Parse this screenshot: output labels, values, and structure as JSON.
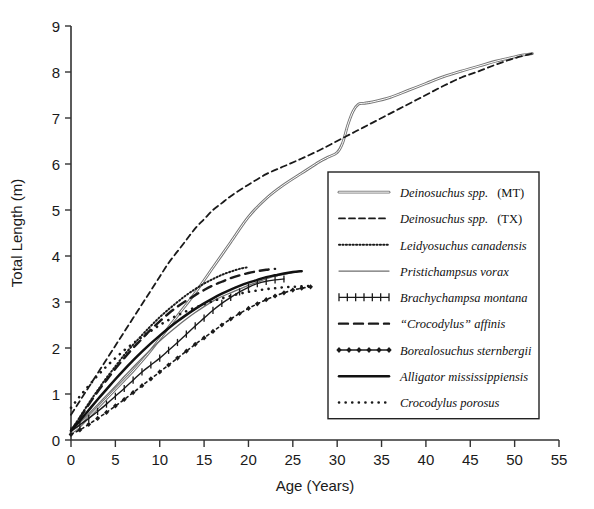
{
  "figure": {
    "name": "crocodylian-growth-curves",
    "background": "#ffffff"
  },
  "chart_data": {
    "type": "line",
    "title": "",
    "xlabel": "Age (Years)",
    "ylabel": "Total Length (m)",
    "xlim": [
      0,
      55
    ],
    "ylim": [
      0,
      9
    ],
    "xticks": [
      0,
      5,
      10,
      15,
      20,
      25,
      30,
      35,
      40,
      45,
      50,
      55
    ],
    "yticks": [
      0,
      1,
      2,
      3,
      4,
      5,
      6,
      7,
      8,
      9
    ],
    "grid": false,
    "legend_position": "center-right-inside",
    "series": [
      {
        "name": "Deinosuchus spp.  (MT)",
        "label_italic": "Deinosuchus spp.",
        "label_plain": "(MT)",
        "style": "double-thin-solid",
        "color": "#555555",
        "width": 1.1,
        "x": [
          0,
          1,
          2,
          3,
          4,
          5,
          6,
          7,
          8,
          9,
          10,
          12,
          14,
          16,
          18,
          20,
          22,
          24,
          26,
          28,
          29,
          30,
          30.6,
          31.2,
          31.8,
          32.4,
          33,
          34,
          36,
          38,
          40,
          42,
          44,
          46,
          48,
          50,
          51,
          52
        ],
        "y": [
          0.15,
          0.3,
          0.5,
          0.7,
          0.9,
          1.1,
          1.3,
          1.5,
          1.72,
          1.95,
          2.2,
          2.7,
          3.2,
          3.75,
          4.3,
          4.85,
          5.25,
          5.55,
          5.8,
          6.05,
          6.15,
          6.25,
          6.45,
          6.85,
          7.15,
          7.3,
          7.32,
          7.35,
          7.45,
          7.6,
          7.75,
          7.9,
          8.02,
          8.13,
          8.24,
          8.33,
          8.37,
          8.4
        ]
      },
      {
        "name": "Deinosuchus spp.  (TX)",
        "label_italic": "Deinosuchus spp.",
        "label_plain": "(TX)",
        "style": "dashed",
        "color": "#1a1a1a",
        "width": 1.8,
        "x": [
          0,
          1,
          2,
          3,
          4,
          5,
          6,
          7,
          8,
          9,
          10,
          11,
          12,
          13,
          14,
          15,
          16,
          17,
          18,
          20,
          22,
          24,
          26,
          28,
          30,
          32,
          34,
          36,
          38,
          40,
          42,
          44,
          46,
          48,
          50,
          52
        ],
        "y": [
          0.55,
          0.85,
          1.15,
          1.45,
          1.75,
          2.05,
          2.35,
          2.65,
          2.95,
          3.25,
          3.55,
          3.85,
          4.1,
          4.35,
          4.6,
          4.8,
          5.0,
          5.15,
          5.3,
          5.55,
          5.78,
          5.95,
          6.12,
          6.3,
          6.5,
          6.7,
          6.9,
          7.1,
          7.3,
          7.5,
          7.7,
          7.88,
          8.02,
          8.17,
          8.3,
          8.4
        ]
      },
      {
        "name": "Leidyosuchus canadensis",
        "label_italic": "Leidyosuchus canadensis",
        "label_plain": "",
        "style": "fine-dotted",
        "color": "#1a1a1a",
        "width": 2.0,
        "x": [
          0,
          1,
          2,
          3,
          4,
          5,
          6,
          7,
          8,
          9,
          10,
          11,
          12,
          13,
          14,
          15,
          16,
          17,
          18,
          19,
          20
        ],
        "y": [
          0.2,
          0.5,
          0.8,
          1.08,
          1.35,
          1.6,
          1.85,
          2.07,
          2.28,
          2.48,
          2.67,
          2.84,
          3.0,
          3.15,
          3.28,
          3.4,
          3.5,
          3.59,
          3.66,
          3.72,
          3.76
        ]
      },
      {
        "name": "Pristichampsus vorax",
        "label_italic": "Pristichampsus vorax",
        "label_plain": "",
        "style": "thin-solid",
        "color": "#6e6e6e",
        "width": 1.3,
        "x": [
          0,
          1,
          2,
          3,
          4,
          5,
          6,
          7,
          8,
          9,
          10,
          11,
          12,
          13,
          14,
          15,
          16,
          17,
          18,
          19,
          20,
          21,
          22,
          23,
          24,
          25,
          26
        ],
        "y": [
          0.2,
          0.38,
          0.57,
          0.77,
          0.97,
          1.17,
          1.38,
          1.58,
          1.78,
          1.97,
          2.15,
          2.32,
          2.48,
          2.63,
          2.77,
          2.9,
          3.02,
          3.12,
          3.2,
          3.28,
          3.36,
          3.43,
          3.5,
          3.56,
          3.6,
          3.64,
          3.68
        ]
      },
      {
        "name": "Brachychampsa montana",
        "label_italic": "Brachychampsa montana",
        "label_plain": "",
        "style": "plus-marked",
        "color": "#1a1a1a",
        "width": 1.4,
        "x": [
          0,
          1,
          2,
          3,
          4,
          5,
          6,
          7,
          8,
          9,
          10,
          11,
          12,
          13,
          14,
          15,
          16,
          17,
          18,
          19,
          20,
          21,
          22,
          23,
          24
        ],
        "y": [
          0.2,
          0.33,
          0.47,
          0.62,
          0.78,
          0.95,
          1.12,
          1.3,
          1.48,
          1.63,
          1.78,
          1.95,
          2.12,
          2.3,
          2.48,
          2.65,
          2.82,
          2.97,
          3.1,
          3.22,
          3.32,
          3.4,
          3.45,
          3.48,
          3.5
        ]
      },
      {
        "name": "“Crocodylus” affinis",
        "label_italic": "“Crocodylus” affinis",
        "label_plain": "",
        "style": "thick-dashed",
        "color": "#1a1a1a",
        "width": 2.4,
        "x": [
          0,
          1,
          2,
          3,
          4,
          5,
          6,
          7,
          8,
          9,
          10,
          11,
          12,
          13,
          14,
          15,
          16,
          17,
          18,
          19,
          20,
          21,
          22,
          23
        ],
        "y": [
          0.2,
          0.48,
          0.77,
          1.05,
          1.3,
          1.55,
          1.78,
          2.0,
          2.2,
          2.4,
          2.58,
          2.75,
          2.9,
          3.03,
          3.15,
          3.26,
          3.36,
          3.44,
          3.52,
          3.58,
          3.63,
          3.67,
          3.7,
          3.72
        ]
      },
      {
        "name": "Borealosuchus sternbergii",
        "label_italic": "Borealosuchus sternbergii",
        "label_plain": "",
        "style": "diamond-dotted",
        "color": "#1a1a1a",
        "width": 1.6,
        "x": [
          0,
          1,
          2,
          3,
          4,
          5,
          6,
          7,
          8,
          9,
          10,
          11,
          12,
          13,
          14,
          15,
          16,
          17,
          18,
          19,
          20,
          21,
          22,
          23,
          24,
          25,
          26,
          27
        ],
        "y": [
          0.12,
          0.22,
          0.34,
          0.47,
          0.6,
          0.74,
          0.88,
          1.03,
          1.18,
          1.33,
          1.48,
          1.63,
          1.78,
          1.93,
          2.08,
          2.22,
          2.36,
          2.5,
          2.63,
          2.75,
          2.86,
          2.96,
          3.05,
          3.13,
          3.2,
          3.26,
          3.3,
          3.33
        ]
      },
      {
        "name": "Alligator mississippiensis",
        "label_italic": "Alligator mississippiensis",
        "label_plain": "",
        "style": "thick-solid",
        "color": "#111111",
        "width": 2.5,
        "x": [
          0,
          1,
          2,
          3,
          4,
          5,
          6,
          7,
          8,
          9,
          10,
          11,
          12,
          13,
          14,
          15,
          16,
          17,
          18,
          19,
          20,
          21,
          22,
          23,
          24,
          25,
          26
        ],
        "y": [
          0.2,
          0.42,
          0.65,
          0.88,
          1.1,
          1.32,
          1.53,
          1.73,
          1.92,
          2.1,
          2.27,
          2.43,
          2.58,
          2.72,
          2.85,
          2.97,
          3.08,
          3.18,
          3.27,
          3.35,
          3.42,
          3.48,
          3.54,
          3.58,
          3.62,
          3.65,
          3.67
        ]
      },
      {
        "name": "Crocodylus porosus",
        "label_italic": "Crocodylus porosus",
        "label_plain": "",
        "style": "coarse-dotted",
        "color": "#1a1a1a",
        "width": 2.6,
        "x": [
          0,
          1,
          2,
          3,
          4,
          5,
          6,
          7,
          8,
          9,
          10,
          11,
          12,
          13,
          14,
          15,
          16,
          17,
          18,
          19,
          20,
          21,
          22,
          23,
          24,
          25,
          26,
          27
        ],
        "y": [
          0.7,
          0.95,
          1.18,
          1.4,
          1.6,
          1.78,
          1.95,
          2.1,
          2.24,
          2.37,
          2.5,
          2.61,
          2.71,
          2.8,
          2.88,
          2.95,
          3.02,
          3.08,
          3.13,
          3.18,
          3.22,
          3.25,
          3.28,
          3.3,
          3.32,
          3.33,
          3.34,
          3.35
        ]
      }
    ]
  }
}
